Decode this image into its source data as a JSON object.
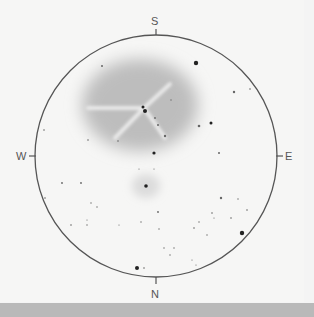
{
  "sketch": {
    "subject": "telescope field sketch of nebula and star field",
    "circle": {
      "cx": 156,
      "cy": 156,
      "r": 121,
      "stroke": "#555555"
    },
    "compass": {
      "top": "S",
      "bottom": "N",
      "left": "W",
      "right": "E"
    },
    "nebulae": [
      {
        "name": "main-nebula",
        "cx": 140,
        "cy": 105,
        "rx": 58,
        "ry": 46,
        "color": "#bdbdbd"
      },
      {
        "name": "small-nebula",
        "cx": 146,
        "cy": 186,
        "rx": 14,
        "ry": 12,
        "color": "#dcdcdc"
      }
    ],
    "stars": [
      {
        "x": 196,
        "y": 63,
        "r": 2.2
      },
      {
        "x": 102,
        "y": 66,
        "r": 1
      },
      {
        "x": 234,
        "y": 92,
        "r": 1.2
      },
      {
        "x": 250,
        "y": 89,
        "r": 0.8
      },
      {
        "x": 143,
        "y": 107,
        "r": 1.5
      },
      {
        "x": 145,
        "y": 111,
        "r": 2
      },
      {
        "x": 155,
        "y": 118,
        "r": 0.9
      },
      {
        "x": 158,
        "y": 125,
        "r": 1
      },
      {
        "x": 165,
        "y": 136,
        "r": 1.2
      },
      {
        "x": 171,
        "y": 100,
        "r": 0.7
      },
      {
        "x": 199,
        "y": 126,
        "r": 1.3
      },
      {
        "x": 211,
        "y": 123,
        "r": 1.5
      },
      {
        "x": 88,
        "y": 140,
        "r": 0.8
      },
      {
        "x": 118,
        "y": 141,
        "r": 0.8
      },
      {
        "x": 154,
        "y": 153,
        "r": 1.6
      },
      {
        "x": 219,
        "y": 153,
        "r": 1
      },
      {
        "x": 44,
        "y": 130,
        "r": 0.8
      },
      {
        "x": 146,
        "y": 186,
        "r": 1.8
      },
      {
        "x": 139,
        "y": 169,
        "r": 0.6
      },
      {
        "x": 154,
        "y": 169,
        "r": 0.6
      },
      {
        "x": 62,
        "y": 183,
        "r": 0.9
      },
      {
        "x": 81,
        "y": 183,
        "r": 0.9
      },
      {
        "x": 45,
        "y": 198,
        "r": 0.8
      },
      {
        "x": 221,
        "y": 198,
        "r": 1.2
      },
      {
        "x": 238,
        "y": 199,
        "r": 0.7
      },
      {
        "x": 91,
        "y": 203,
        "r": 0.7
      },
      {
        "x": 97,
        "y": 207,
        "r": 0.7
      },
      {
        "x": 158,
        "y": 212,
        "r": 0.9
      },
      {
        "x": 212,
        "y": 213,
        "r": 0.8
      },
      {
        "x": 247,
        "y": 210,
        "r": 0.8
      },
      {
        "x": 87,
        "y": 220,
        "r": 0.6
      },
      {
        "x": 71,
        "y": 225,
        "r": 0.8
      },
      {
        "x": 87,
        "y": 225,
        "r": 0.7
      },
      {
        "x": 119,
        "y": 225,
        "r": 0.6
      },
      {
        "x": 141,
        "y": 222,
        "r": 0.7
      },
      {
        "x": 199,
        "y": 222,
        "r": 0.7
      },
      {
        "x": 214,
        "y": 218,
        "r": 0.6
      },
      {
        "x": 231,
        "y": 218,
        "r": 0.8
      },
      {
        "x": 194,
        "y": 228,
        "r": 0.8
      },
      {
        "x": 159,
        "y": 229,
        "r": 0.7
      },
      {
        "x": 242,
        "y": 233,
        "r": 2.2
      },
      {
        "x": 207,
        "y": 235,
        "r": 0.7
      },
      {
        "x": 164,
        "y": 248,
        "r": 0.7
      },
      {
        "x": 174,
        "y": 248,
        "r": 0.7
      },
      {
        "x": 170,
        "y": 255,
        "r": 0.7
      },
      {
        "x": 192,
        "y": 260,
        "r": 0.6
      },
      {
        "x": 196,
        "y": 265,
        "r": 0.6
      },
      {
        "x": 137,
        "y": 268,
        "r": 2
      },
      {
        "x": 144,
        "y": 268,
        "r": 0.8
      }
    ],
    "background": "#f6f6f5",
    "bottom_strip": "#b9b9b9"
  }
}
